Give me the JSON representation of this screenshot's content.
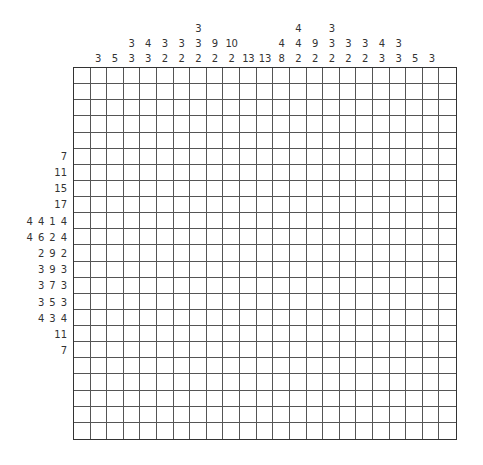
{
  "puzzle": {
    "type": "nonogram",
    "rows": 23,
    "cols": 23,
    "column_clues": [
      [],
      [
        3
      ],
      [
        5
      ],
      [
        3,
        3
      ],
      [
        4,
        3
      ],
      [
        3,
        2
      ],
      [
        3,
        2
      ],
      [
        3,
        3,
        2
      ],
      [
        9,
        2
      ],
      [
        10,
        2
      ],
      [
        13
      ],
      [
        13
      ],
      [
        4,
        8
      ],
      [
        4,
        4,
        2
      ],
      [
        9,
        2
      ],
      [
        3,
        3,
        2
      ],
      [
        3,
        2
      ],
      [
        3,
        2
      ],
      [
        4,
        3
      ],
      [
        3,
        3
      ],
      [
        5
      ],
      [
        3
      ],
      []
    ],
    "row_clues": [
      [],
      [],
      [],
      [],
      [],
      [
        7
      ],
      [
        11
      ],
      [
        15
      ],
      [
        17
      ],
      [
        4,
        4,
        1,
        4
      ],
      [
        4,
        6,
        2,
        4
      ],
      [
        2,
        9,
        2
      ],
      [
        3,
        9,
        3
      ],
      [
        3,
        7,
        3
      ],
      [
        3,
        5,
        3
      ],
      [
        4,
        3,
        4
      ],
      [
        11
      ],
      [
        7
      ],
      [],
      [],
      [],
      [],
      []
    ],
    "colors": {
      "grid_line": "#555555",
      "border": "#333333",
      "cell_empty": "#ffffff",
      "clue_text": "#333333"
    }
  }
}
